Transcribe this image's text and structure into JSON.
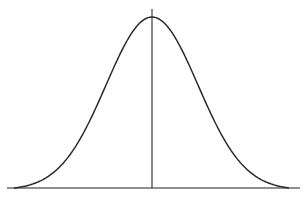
{
  "diagram": {
    "type": "normal-distribution-bell-curve",
    "stroke_color": "#2b2b2b",
    "axis_color": "#6a6a6a",
    "background": "#ffffff",
    "baseline": {
      "x1": 7,
      "x2": 300,
      "y": 188
    },
    "mean_line": {
      "x": 152,
      "y1": 9,
      "y2": 188
    },
    "curve": {
      "center_x": 152,
      "peak_y": 17,
      "base_y": 190,
      "sigma_px": 46,
      "x_start": 14,
      "x_end": 289
    }
  }
}
